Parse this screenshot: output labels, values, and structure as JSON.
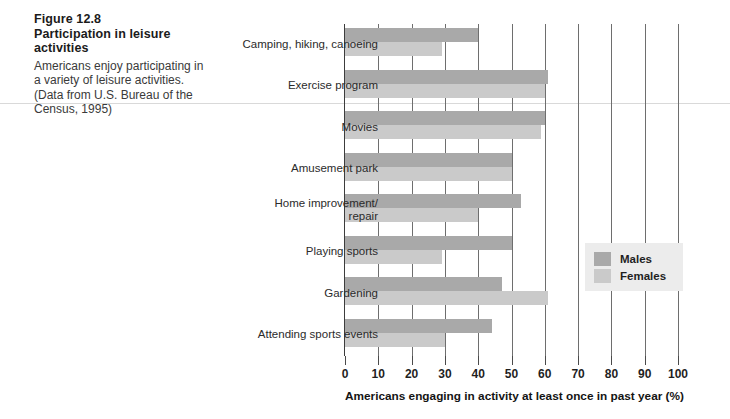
{
  "figure": {
    "number_label": "Figure 12.8",
    "title": "Participation in leisure activities",
    "description": "Americans enjoy participating in a variety of leisure activities. (Data from U.S. Bureau of the Census, 1995)"
  },
  "legend": {
    "position": "right-middle",
    "items": [
      {
        "label": "Males",
        "color": "#a9a9a9"
      },
      {
        "label": "Females",
        "color": "#cacaca"
      }
    ]
  },
  "chart_data": {
    "type": "bar",
    "orientation": "horizontal",
    "title": "Participation in leisure activities",
    "xlabel": "Americans engaging in activity at least once in past year (%)",
    "ylabel": "",
    "xlim": [
      0,
      100
    ],
    "xticks": [
      0,
      10,
      20,
      30,
      40,
      50,
      60,
      70,
      80,
      90,
      100
    ],
    "xtick_labels": [
      "0",
      "10",
      "20",
      "30",
      "40",
      "50",
      "60",
      "70",
      "80",
      "90",
      "100"
    ],
    "grid": true,
    "grid_axis": "x",
    "legend_position": "right",
    "categories": [
      "Camping, hiking, canoeing",
      "Exercise program",
      "Movies",
      "Amusement park",
      "Home improvement/ repair",
      "Playing sports",
      "Gardening",
      "Attending sports events"
    ],
    "series": [
      {
        "name": "Males",
        "color": "#a9a9a9",
        "values": [
          40,
          61,
          60,
          50,
          53,
          50,
          47,
          44
        ]
      },
      {
        "name": "Females",
        "color": "#cacaca",
        "values": [
          29,
          60,
          59,
          50,
          40,
          29,
          61,
          30
        ]
      }
    ]
  }
}
